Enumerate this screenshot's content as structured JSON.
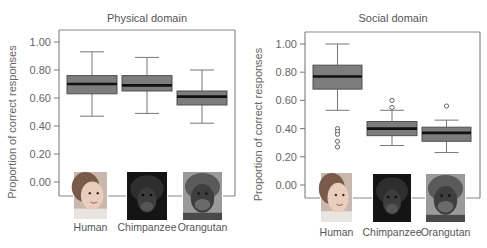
{
  "chart_data": [
    {
      "type": "boxplot",
      "title": "Physical domain",
      "ylabel": "Proportion of correct responses",
      "xlabel": "",
      "ylim": [
        0.0,
        1.0
      ],
      "yticks": [
        "0.00",
        "0.20",
        "0.40",
        "0.60",
        "0.80",
        "1.00"
      ],
      "categories": [
        "Human",
        "Chimpanzee",
        "Orangutan"
      ],
      "series": [
        {
          "name": "Human",
          "whisker_low": 0.47,
          "q1": 0.63,
          "median": 0.7,
          "q3": 0.76,
          "whisker_high": 0.93,
          "outliers": []
        },
        {
          "name": "Chimpanzee",
          "whisker_low": 0.49,
          "q1": 0.65,
          "median": 0.69,
          "q3": 0.76,
          "whisker_high": 0.89,
          "outliers": []
        },
        {
          "name": "Orangutan",
          "whisker_low": 0.42,
          "q1": 0.55,
          "median": 0.61,
          "q3": 0.65,
          "whisker_high": 0.8,
          "outliers": []
        }
      ],
      "category_images": [
        "human-child-photo",
        "chimpanzee-photo",
        "orangutan-photo"
      ],
      "grid": false
    },
    {
      "type": "boxplot",
      "title": "Social domain",
      "ylabel": "Proportion of correct responses",
      "xlabel": "",
      "ylim": [
        0.0,
        1.0
      ],
      "yticks": [
        "0.00",
        "0.20",
        "0.40",
        "0.60",
        "0.80",
        "1.00"
      ],
      "categories": [
        "Human",
        "Chimpanzee",
        "Orangutan"
      ],
      "series": [
        {
          "name": "Human",
          "whisker_low": 0.53,
          "q1": 0.68,
          "median": 0.77,
          "q3": 0.85,
          "whisker_high": 1.0,
          "outliers": [
            0.4,
            0.38,
            0.36,
            0.31,
            0.27
          ]
        },
        {
          "name": "Chimpanzee",
          "whisker_low": 0.28,
          "q1": 0.35,
          "median": 0.4,
          "q3": 0.45,
          "whisker_high": 0.53,
          "outliers": [
            0.6,
            0.55
          ]
        },
        {
          "name": "Orangutan",
          "whisker_low": 0.23,
          "q1": 0.31,
          "median": 0.37,
          "q3": 0.41,
          "whisker_high": 0.46,
          "outliers": [
            0.56
          ]
        }
      ],
      "category_images": [
        "human-child-photo",
        "chimpanzee-photo",
        "orangutan-photo"
      ],
      "grid": false
    }
  ],
  "colors": {
    "box_fill": "#7d7d7d",
    "box_edge": "#505050",
    "median": "#111111",
    "whisker": "#777777",
    "frame": "#888888"
  }
}
